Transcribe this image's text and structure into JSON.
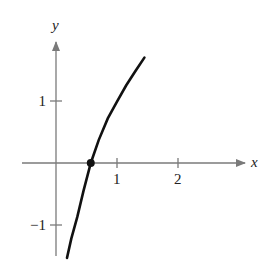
{
  "chart_data": {
    "type": "line",
    "title": "",
    "xlabel": "x",
    "ylabel": "y",
    "xlim": [
      -0.6,
      3.4
    ],
    "ylim": [
      -1.75,
      2.0
    ],
    "grid": false,
    "x_ticks": [
      {
        "value": 1,
        "label": "1"
      },
      {
        "value": 2,
        "label": "2"
      }
    ],
    "y_ticks": [
      {
        "value": 1,
        "label": "1"
      },
      {
        "value": -1,
        "label": "−1"
      }
    ],
    "series": [
      {
        "name": "curve",
        "shape": "logarithmic",
        "x": [
          0.18,
          0.25,
          0.35,
          0.45,
          0.57,
          0.7,
          0.85,
          1.0,
          1.15,
          1.3,
          1.45
        ],
        "y": [
          -1.53,
          -1.22,
          -0.87,
          -0.45,
          0.0,
          0.37,
          0.72,
          0.99,
          1.25,
          1.48,
          1.7
        ]
      }
    ],
    "annotations": [
      {
        "type": "point",
        "x": 0.57,
        "y": 0,
        "label": ""
      }
    ]
  },
  "colors": {
    "axis": "#7a7a7a",
    "curve": "#111111",
    "text": "#222222"
  }
}
